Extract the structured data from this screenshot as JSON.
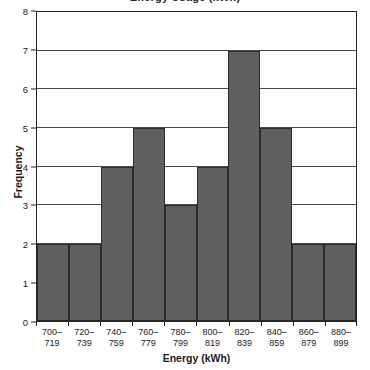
{
  "chart_data": {
    "type": "bar",
    "title": "Energy Usage (kWh)",
    "title_cropped": true,
    "xlabel": "Energy (kWh)",
    "ylabel": "Frequency",
    "categories": [
      "700-719",
      "720-739",
      "740-759",
      "760-779",
      "780-799",
      "800-819",
      "820-839",
      "840-859",
      "860-879",
      "880-899"
    ],
    "category_lines": [
      [
        "700–",
        "719"
      ],
      [
        "720–",
        "739"
      ],
      [
        "740–",
        "759"
      ],
      [
        "760–",
        "779"
      ],
      [
        "780–",
        "799"
      ],
      [
        "800–",
        "819"
      ],
      [
        "820–",
        "839"
      ],
      [
        "840–",
        "859"
      ],
      [
        "860–",
        "879"
      ],
      [
        "880–",
        "899"
      ]
    ],
    "values": [
      2,
      2,
      4,
      5,
      3,
      4,
      7,
      5,
      2,
      2
    ],
    "ylim": [
      0,
      8
    ],
    "yticks": [
      0,
      1,
      2,
      3,
      4,
      5,
      6,
      7,
      8
    ],
    "ytick_labels": [
      "0",
      "1",
      "2",
      "3",
      "4",
      "5",
      "6",
      "7",
      "8"
    ],
    "grid": "horizontal",
    "legend": "none",
    "bar_color": "#5f5f5f",
    "bar_edge_color": "#2b2b2b",
    "gridline_color": "#4a4a4a",
    "axis_color": "#222222",
    "background_color": "#ffffff"
  }
}
